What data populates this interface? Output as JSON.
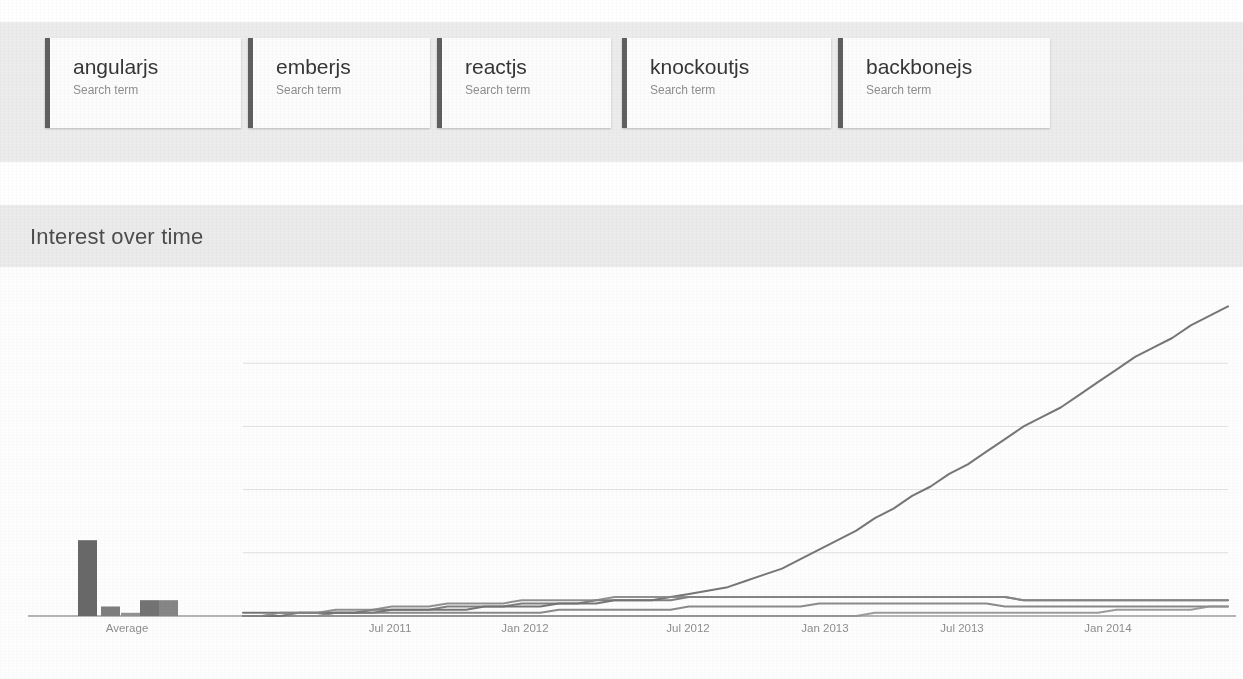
{
  "page": {
    "section_title": "Interest over time"
  },
  "terms": {
    "subtitle": "Search term",
    "items": [
      {
        "label": "angularjs",
        "subtitle": "Search term",
        "accent": "#5a5a5a",
        "left": 45,
        "width": 196
      },
      {
        "label": "emberjs",
        "subtitle": "Search term",
        "accent": "#5a5a5a",
        "left": 248,
        "width": 182
      },
      {
        "label": "reactjs",
        "subtitle": "Search term",
        "accent": "#5a5a5a",
        "left": 437,
        "width": 174
      },
      {
        "label": "knockoutjs",
        "subtitle": "Search term",
        "accent": "#5a5a5a",
        "left": 622,
        "width": 209
      },
      {
        "label": "backbonejs",
        "subtitle": "Search term",
        "accent": "#5a5a5a",
        "left": 838,
        "width": 212
      }
    ]
  },
  "bleed_text": [
    {
      "text": "of notes by",
      "left": 1120,
      "top": 30
    },
    {
      "text": "and illustrations",
      "left": 1090,
      "top": 48
    },
    {
      "text": "Design 1. Vignet",
      "left": 1110,
      "top": 128
    },
    {
      "text": "of the particular",
      "left": 470,
      "top": 300
    },
    {
      "text": "there is one common",
      "left": 720,
      "top": 300
    },
    {
      "text": "the same then",
      "left": 1075,
      "top": 320
    },
    {
      "text": "a unique sub-section",
      "left": 480,
      "top": 318
    },
    {
      "text": "of a section it may",
      "left": 760,
      "top": 318
    },
    {
      "text": "sections of the",
      "left": 500,
      "top": 340
    },
    {
      "text": "for each sub",
      "left": 770,
      "top": 340
    },
    {
      "text": "that is not",
      "left": 1075,
      "top": 340
    },
    {
      "text": "the illustration",
      "left": 510,
      "top": 362
    },
    {
      "text": "made but",
      "left": 790,
      "top": 362
    },
    {
      "text": "cho",
      "left": 1090,
      "top": 362
    },
    {
      "text": "one of the",
      "left": 420,
      "top": 478
    },
    {
      "text": "in the",
      "left": 1075,
      "top": 430
    },
    {
      "text": "it is not",
      "left": 1080,
      "top": 492
    },
    {
      "text": "then the result will be",
      "left": 380,
      "top": 560
    },
    {
      "text": "nothing to do with the",
      "left": 700,
      "top": 560
    },
    {
      "text": "the chapter",
      "left": 1050,
      "top": 560
    },
    {
      "text": "other than that",
      "left": 180,
      "top": 578
    },
    {
      "text": "the source listing",
      "left": 640,
      "top": 578
    },
    {
      "text": "of sub",
      "left": 1060,
      "top": 600
    },
    {
      "text": "one would expect",
      "left": 120,
      "top": 646
    },
    {
      "text": "listed then the",
      "left": 520,
      "top": 646
    },
    {
      "text": "a figure that",
      "left": 900,
      "top": 646
    }
  ],
  "chart_data": {
    "type": "line",
    "title": "Interest over time",
    "xlabel": "",
    "ylabel": "",
    "ylim": [
      0,
      100
    ],
    "grid": true,
    "gridlines_y": [
      20,
      40,
      60,
      80
    ],
    "legend_position": "top-cards",
    "average_section_label": "Average",
    "tick_labels": [
      "Average",
      "Jul 2011",
      "Jan 2012",
      "Jul 2012",
      "Jan 2013",
      "Jul 2013",
      "Jan 2014"
    ],
    "tick_x_px": [
      127,
      390,
      525,
      688,
      825,
      962,
      1108
    ],
    "axis": {
      "baseline_y_px": 616,
      "plot_top_y_px": 300,
      "plot_left_px": 243,
      "plot_right_px": 1228,
      "value_per_px": 0.3165
    },
    "average_bars": {
      "categories": [
        "angularjs",
        "emberjs",
        "reactjs",
        "knockoutjs",
        "backbonejs"
      ],
      "values": [
        24,
        3,
        1,
        5,
        5
      ],
      "bar_x_px": [
        78,
        101,
        121,
        140,
        159
      ],
      "bar_width_px": 19
    },
    "series": [
      {
        "name": "angularjs",
        "color": "#636363",
        "values": [
          1,
          1,
          1,
          1,
          1,
          1,
          1,
          1,
          2,
          2,
          2,
          2,
          2,
          3,
          3,
          3,
          3,
          4,
          4,
          4,
          5,
          5,
          5,
          6,
          7,
          8,
          9,
          11,
          13,
          15,
          18,
          21,
          24,
          27,
          31,
          34,
          38,
          41,
          45,
          48,
          52,
          56,
          60,
          63,
          66,
          70,
          74,
          78,
          82,
          85,
          88,
          92,
          95,
          98
        ]
      },
      {
        "name": "emberjs",
        "color": "#7a7a7a",
        "values": [
          0,
          0,
          0,
          0,
          0,
          1,
          1,
          1,
          1,
          1,
          1,
          1,
          1,
          1,
          1,
          1,
          1,
          2,
          2,
          2,
          2,
          2,
          2,
          2,
          3,
          3,
          3,
          3,
          3,
          3,
          3,
          4,
          4,
          4,
          4,
          4,
          4,
          4,
          4,
          4,
          4,
          3,
          3,
          3,
          3,
          3,
          3,
          3,
          3,
          3,
          3,
          3,
          3,
          3
        ]
      },
      {
        "name": "reactjs",
        "color": "#8f8f8f",
        "values": [
          0,
          0,
          0,
          0,
          0,
          0,
          0,
          0,
          0,
          0,
          0,
          0,
          0,
          0,
          0,
          0,
          0,
          0,
          0,
          0,
          0,
          0,
          0,
          0,
          0,
          0,
          0,
          0,
          0,
          0,
          0,
          0,
          0,
          0,
          1,
          1,
          1,
          1,
          1,
          1,
          1,
          1,
          1,
          1,
          1,
          1,
          1,
          2,
          2,
          2,
          2,
          2,
          3,
          3
        ]
      },
      {
        "name": "knockoutjs",
        "color": "#6e6e6e",
        "values": [
          0,
          0,
          0,
          1,
          1,
          1,
          1,
          2,
          2,
          2,
          2,
          3,
          3,
          3,
          3,
          4,
          4,
          4,
          4,
          5,
          5,
          5,
          5,
          5,
          6,
          6,
          6,
          6,
          6,
          6,
          6,
          6,
          6,
          6,
          6,
          6,
          6,
          6,
          6,
          6,
          6,
          6,
          5,
          5,
          5,
          5,
          5,
          5,
          5,
          5,
          5,
          5,
          5,
          5
        ]
      },
      {
        "name": "backbonejs",
        "color": "#828282",
        "values": [
          0,
          0,
          1,
          1,
          1,
          2,
          2,
          2,
          3,
          3,
          3,
          4,
          4,
          4,
          4,
          5,
          5,
          5,
          5,
          5,
          6,
          6,
          6,
          6,
          6,
          6,
          6,
          6,
          6,
          6,
          6,
          6,
          6,
          6,
          6,
          6,
          6,
          6,
          6,
          6,
          6,
          6,
          5,
          5,
          5,
          5,
          5,
          5,
          5,
          5,
          5,
          5,
          5,
          5
        ]
      }
    ]
  }
}
